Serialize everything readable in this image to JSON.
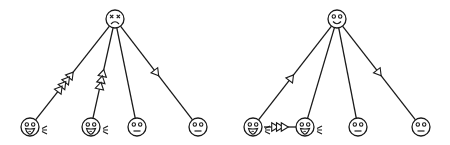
{
  "diagrams": [
    {
      "name": "left-diagram",
      "root": {
        "x": 115,
        "y": 19,
        "r": 9,
        "expression": "dead-sad"
      },
      "leaves": [
        {
          "x": 30,
          "y": 127,
          "r": 9,
          "expression": "laughing"
        },
        {
          "x": 91,
          "y": 127,
          "r": 9,
          "expression": "laughing"
        },
        {
          "x": 137,
          "y": 127,
          "r": 9,
          "expression": "neutral"
        },
        {
          "x": 198,
          "y": 127,
          "r": 9,
          "expression": "neutral"
        }
      ],
      "edges": [
        {
          "from": "root",
          "to": 0,
          "arrows": 4,
          "direction": "up",
          "arrow_t": [
            0.52,
            0.57,
            0.62,
            0.67
          ]
        },
        {
          "from": "root",
          "to": 1,
          "arrows": 3,
          "direction": "up",
          "arrow_t": [
            0.5,
            0.57,
            0.64
          ]
        },
        {
          "from": "root",
          "to": 2,
          "arrows": 0,
          "direction": "none",
          "arrow_t": []
        },
        {
          "from": "root",
          "to": 3,
          "arrows": 1,
          "direction": "down",
          "arrow_t": [
            0.5
          ]
        }
      ],
      "lateral_edges": []
    },
    {
      "name": "right-diagram",
      "root": {
        "x": 337,
        "y": 19,
        "r": 9,
        "expression": "happy"
      },
      "leaves": [
        {
          "x": 253,
          "y": 127,
          "r": 9,
          "expression": "laughing"
        },
        {
          "x": 305,
          "y": 127,
          "r": 9,
          "expression": "laughing"
        },
        {
          "x": 358,
          "y": 127,
          "r": 9,
          "expression": "neutral"
        },
        {
          "x": 421,
          "y": 127,
          "r": 9,
          "expression": "neutral"
        }
      ],
      "edges": [
        {
          "from": "root",
          "to": 0,
          "arrows": 1,
          "direction": "up",
          "arrow_t": [
            0.55
          ]
        },
        {
          "from": "root",
          "to": 1,
          "arrows": 0,
          "direction": "none",
          "arrow_t": []
        },
        {
          "from": "root",
          "to": 2,
          "arrows": 0,
          "direction": "none",
          "arrow_t": []
        },
        {
          "from": "root",
          "to": 3,
          "arrows": 1,
          "direction": "down",
          "arrow_t": [
            0.5
          ]
        }
      ],
      "lateral_edges": [
        {
          "from": 0,
          "to": 1,
          "arrows": 3,
          "direction": "right",
          "arrow_t": [
            0.35,
            0.5,
            0.65
          ]
        }
      ]
    }
  ],
  "style": {
    "stroke": "#1a1a1a",
    "background": "#ffffff",
    "arrow_fill": "#ffffff"
  }
}
